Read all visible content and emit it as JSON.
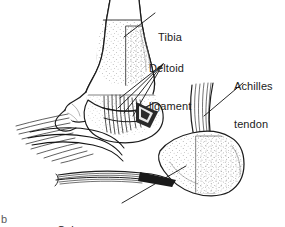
{
  "figure": {
    "type": "anatomical-line-drawing",
    "background_color": "#ffffff",
    "ink_color": "#1c1c1c",
    "corner_mark": "b"
  },
  "labels": [
    {
      "id": "tibia",
      "text": "Tibia",
      "lines": [
        "Tibia"
      ]
    },
    {
      "id": "deltoid",
      "text": "Deltoid ligament",
      "lines": [
        "Deltoid",
        "ligament"
      ]
    },
    {
      "id": "achilles",
      "text": "Achilles tendon",
      "lines": [
        "Achilles",
        "tendon"
      ]
    },
    {
      "id": "calcaneus",
      "text": "Calcaneus",
      "lines": [
        "Calcaneus"
      ]
    }
  ],
  "structures": [
    {
      "name": "tibia",
      "description": "Distal tibia shaft descending from top center"
    },
    {
      "name": "medial-malleolus",
      "description": "Bony prominence at distal tibia"
    },
    {
      "name": "deltoid-ligament",
      "description": "Fan of ligament fibers from medial malleolus"
    },
    {
      "name": "achilles-tendon",
      "description": "Broad striated tendon inserting posteriorly"
    },
    {
      "name": "calcaneus",
      "description": "Heel bone, stippled, lower right"
    },
    {
      "name": "navicular-talus-region",
      "description": "Mid-foot bones at left"
    },
    {
      "name": "plantar-fascia",
      "description": "Fibers running to lower left from calcaneus"
    }
  ]
}
